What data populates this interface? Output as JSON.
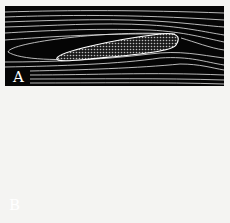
{
  "figure": {
    "background": "#f4f4f2",
    "flow_color": "#ffffff",
    "field_color": "#050505",
    "panels": [
      {
        "label": "A",
        "state": "attached flow, small angle of attack"
      },
      {
        "label": "B",
        "state": "stalled flow, high angle of attack with vortices above wing"
      }
    ]
  }
}
